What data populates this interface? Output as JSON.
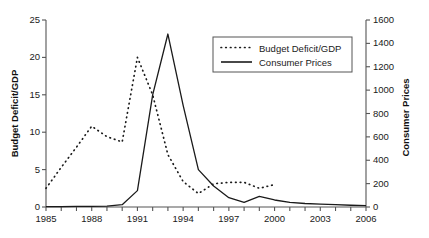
{
  "chart_data": {
    "type": "line",
    "title": "",
    "xlabel": "",
    "ylabel": "Budget Deficit/GDP",
    "ylabel_right": "Consumer Prices",
    "xlim": [
      1985,
      2006
    ],
    "ylim": [
      0,
      25
    ],
    "ylim_right": [
      0,
      1600
    ],
    "grid": false,
    "legend_position": "upper-right-inside",
    "xticks": [
      1985,
      1986,
      1987,
      1988,
      1989,
      1990,
      1991,
      1992,
      1993,
      1994,
      1995,
      1996,
      1997,
      1998,
      1999,
      2000,
      2001,
      2002,
      2003,
      2004,
      2005,
      2006
    ],
    "xtick_labels": [
      "1985",
      "",
      "",
      "1988",
      "",
      "",
      "1991",
      "",
      "",
      "1994",
      "",
      "",
      "1997",
      "",
      "",
      "2000",
      "",
      "",
      "2003",
      "",
      "",
      "2006"
    ],
    "yticks_left": [
      0,
      5,
      10,
      15,
      20,
      25
    ],
    "ytick_labels_left": [
      "0",
      "5",
      "10",
      "15",
      "20",
      "25"
    ],
    "yticks_right": [
      0,
      200,
      400,
      600,
      800,
      1000,
      1200,
      1400,
      1600
    ],
    "ytick_labels_right": [
      "0",
      "200",
      "400",
      "600",
      "800",
      "1000",
      "1200",
      "1400",
      "1600"
    ],
    "series": [
      {
        "name": "Budget Deficit/GDP",
        "axis": "left",
        "style": "dotted",
        "color": "#1a1a1a",
        "x": [
          1985,
          1986,
          1987,
          1988,
          1989,
          1990,
          1991,
          1992,
          1993,
          1994,
          1995,
          1996,
          1997,
          1998,
          1999,
          2000
        ],
        "values": [
          2.5,
          5.3,
          8.0,
          10.8,
          9.4,
          8.7,
          20.0,
          15.0,
          7.0,
          3.4,
          1.8,
          3.1,
          3.3,
          3.3,
          2.5,
          3.0
        ]
      },
      {
        "name": "Consumer Prices",
        "axis": "right",
        "style": "solid",
        "color": "#1a1a1a",
        "x": [
          1985,
          1986,
          1987,
          1988,
          1989,
          1990,
          1991,
          1992,
          1993,
          1994,
          1995,
          1996,
          1997,
          1998,
          1999,
          2000,
          2001,
          2002,
          2003,
          2004,
          2005,
          2006
        ],
        "values": [
          3,
          4,
          5,
          6,
          8,
          20,
          140,
          960,
          1480,
          870,
          320,
          180,
          80,
          40,
          90,
          60,
          40,
          30,
          25,
          20,
          15,
          12
        ]
      }
    ]
  },
  "legend": {
    "items": [
      {
        "label": "Budget Deficit/GDP",
        "style": "dotted"
      },
      {
        "label": "Consumer Prices",
        "style": "solid"
      }
    ]
  },
  "axes": {
    "left_title": "Budget Deficit/GDP",
    "right_title": "Consumer Prices"
  }
}
